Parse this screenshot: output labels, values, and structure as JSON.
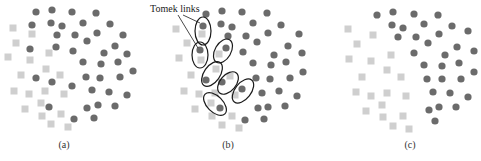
{
  "figure": {
    "colors": {
      "majority_circle": "#6b6b6b",
      "minority_square": "#cfcfcf",
      "ellipse_stroke": "#1a1a1a",
      "text": "#333333"
    },
    "annotation": {
      "label": "Tomek links",
      "x": 150,
      "y": 12,
      "pointers": [
        [
          183,
          15,
          200,
          23
        ],
        [
          178,
          15,
          198,
          48
        ]
      ]
    },
    "panels": [
      {
        "id": "a",
        "label": "(a)",
        "label_pos": [
          64,
          148
        ],
        "circles": [
          [
            36,
            12
          ],
          [
            52,
            10
          ],
          [
            72,
            12
          ],
          [
            96,
            13
          ],
          [
            32,
            25
          ],
          [
            51,
            23
          ],
          [
            62,
            26
          ],
          [
            83,
            23
          ],
          [
            110,
            24
          ],
          [
            57,
            35
          ],
          [
            75,
            35
          ],
          [
            97,
            33
          ],
          [
            123,
            35
          ],
          [
            87,
            41
          ],
          [
            30,
            49
          ],
          [
            56,
            47
          ],
          [
            73,
            51
          ],
          [
            115,
            46
          ],
          [
            104,
            53
          ],
          [
            127,
            54
          ],
          [
            83,
            62
          ],
          [
            101,
            64
          ],
          [
            118,
            62
          ],
          [
            133,
            71
          ],
          [
            36,
            78
          ],
          [
            52,
            82
          ],
          [
            86,
            77
          ],
          [
            100,
            78
          ],
          [
            120,
            77
          ],
          [
            72,
            86
          ],
          [
            92,
            90
          ],
          [
            109,
            92
          ],
          [
            127,
            95
          ],
          [
            49,
            107
          ],
          [
            87,
            108
          ],
          [
            98,
            105
          ],
          [
            115,
            106
          ],
          [
            74,
            119
          ],
          [
            94,
            118
          ]
        ],
        "squares": [
          [
            13,
            28
          ],
          [
            32,
            34
          ],
          [
            16,
            43
          ],
          [
            8,
            57
          ],
          [
            49,
            53
          ],
          [
            30,
            60
          ],
          [
            46,
            69
          ],
          [
            21,
            75
          ],
          [
            60,
            75
          ],
          [
            14,
            91
          ],
          [
            29,
            94
          ],
          [
            45,
            91
          ],
          [
            64,
            94
          ],
          [
            41,
            103
          ],
          [
            25,
            109
          ],
          [
            42,
            116
          ],
          [
            61,
            114
          ],
          [
            51,
            124
          ],
          [
            68,
            127
          ]
        ],
        "ellipses": []
      },
      {
        "id": "b",
        "label": "(b)",
        "label_pos": [
          228,
          148
        ],
        "circles": [
          [
            206,
            14
          ],
          [
            222,
            11
          ],
          [
            242,
            12
          ],
          [
            267,
            13
          ],
          [
            221,
            24
          ],
          [
            232,
            27
          ],
          [
            253,
            23
          ],
          [
            281,
            25
          ],
          [
            228,
            36
          ],
          [
            246,
            36
          ],
          [
            268,
            33
          ],
          [
            299,
            34
          ],
          [
            257,
            42
          ],
          [
            243,
            52
          ],
          [
            288,
            46
          ],
          [
            274,
            55
          ],
          [
            302,
            53
          ],
          [
            253,
            63
          ],
          [
            271,
            65
          ],
          [
            286,
            62
          ],
          [
            303,
            72
          ],
          [
            256,
            78
          ],
          [
            270,
            79
          ],
          [
            290,
            78
          ],
          [
            262,
            93
          ],
          [
            279,
            91
          ],
          [
            297,
            96
          ],
          [
            258,
            108
          ],
          [
            268,
            107
          ],
          [
            285,
            106
          ],
          [
            245,
            120
          ],
          [
            264,
            119
          ],
          [
            203,
            26
          ],
          [
            200,
            50
          ],
          [
            226,
            48
          ],
          [
            206,
            80
          ],
          [
            222,
            82
          ],
          [
            242,
            89
          ],
          [
            220,
            108
          ]
        ],
        "squares": [
          [
            176,
            29
          ],
          [
            187,
            43
          ],
          [
            179,
            58
          ],
          [
            191,
            75
          ],
          [
            184,
            91
          ],
          [
            199,
            94
          ],
          [
            211,
            103
          ],
          [
            195,
            109
          ],
          [
            212,
            116
          ],
          [
            232,
            116
          ],
          [
            222,
            125
          ],
          [
            239,
            128
          ],
          [
            202,
            34
          ],
          [
            201,
            60
          ],
          [
            219,
            54
          ],
          [
            216,
            69
          ],
          [
            230,
            76
          ],
          [
            215,
            93
          ],
          [
            235,
            95
          ]
        ],
        "ellipses": [
          {
            "cx": 203,
            "cy": 31,
            "rx": 8,
            "ry": 14,
            "rot": 0
          },
          {
            "cx": 200,
            "cy": 55,
            "rx": 8,
            "ry": 13,
            "rot": 0
          },
          {
            "cx": 223,
            "cy": 51,
            "rx": 8,
            "ry": 13,
            "rot": 30
          },
          {
            "cx": 212,
            "cy": 74,
            "rx": 8,
            "ry": 14,
            "rot": 35
          },
          {
            "cx": 228,
            "cy": 83,
            "rx": 8,
            "ry": 13,
            "rot": 40
          },
          {
            "cx": 243,
            "cy": 91,
            "rx": 8,
            "ry": 14,
            "rot": 38
          },
          {
            "cx": 215,
            "cy": 104,
            "rx": 8,
            "ry": 14,
            "rot": -45
          }
        ]
      },
      {
        "id": "c",
        "label": "(c)",
        "label_pos": [
          410,
          148
        ],
        "circles": [
          [
            377,
            15
          ],
          [
            393,
            12
          ],
          [
            414,
            14
          ],
          [
            438,
            15
          ],
          [
            392,
            25
          ],
          [
            403,
            28
          ],
          [
            424,
            24
          ],
          [
            452,
            26
          ],
          [
            398,
            37
          ],
          [
            416,
            37
          ],
          [
            428,
            43
          ],
          [
            439,
            34
          ],
          [
            468,
            31
          ],
          [
            457,
            47
          ],
          [
            474,
            51
          ],
          [
            414,
            53
          ],
          [
            445,
            55
          ],
          [
            424,
            65
          ],
          [
            442,
            66
          ],
          [
            459,
            63
          ],
          [
            474,
            72
          ],
          [
            427,
            79
          ],
          [
            442,
            79
          ],
          [
            461,
            79
          ],
          [
            433,
            92
          ],
          [
            450,
            93
          ],
          [
            468,
            97
          ],
          [
            429,
            110
          ],
          [
            439,
            107
          ],
          [
            456,
            107
          ],
          [
            435,
            121
          ]
        ],
        "squares": [
          [
            348,
            29
          ],
          [
            373,
            35
          ],
          [
            357,
            44
          ],
          [
            349,
            59
          ],
          [
            391,
            55
          ],
          [
            371,
            61
          ],
          [
            387,
            70
          ],
          [
            362,
            77
          ],
          [
            401,
            77
          ],
          [
            356,
            92
          ],
          [
            371,
            96
          ],
          [
            387,
            93
          ],
          [
            406,
            96
          ],
          [
            382,
            105
          ],
          [
            366,
            111
          ],
          [
            383,
            117
          ],
          [
            403,
            116
          ],
          [
            393,
            126
          ],
          [
            409,
            129
          ]
        ],
        "ellipses": []
      }
    ]
  }
}
